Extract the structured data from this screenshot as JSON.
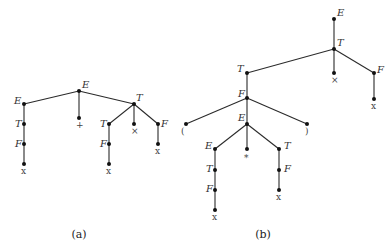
{
  "figure": {
    "captions": {
      "a": "(a)",
      "b": "(b)"
    },
    "colors": {
      "edge": "#2a2a2a",
      "node": "#111111",
      "label": "#333333"
    }
  },
  "tree_a": {
    "nodes": {
      "root": {
        "label": "E",
        "x": 79,
        "y": 91,
        "lx": 82,
        "ly": 88,
        "kind": "nt"
      },
      "e1": {
        "label": "E",
        "x": 24,
        "y": 104,
        "lx": 14,
        "ly": 104,
        "kind": "nt"
      },
      "t1": {
        "label": "T",
        "x": 24,
        "y": 124,
        "lx": 15,
        "ly": 127,
        "kind": "nt"
      },
      "f1": {
        "label": "F",
        "x": 24,
        "y": 144,
        "lx": 15,
        "ly": 147,
        "kind": "nt"
      },
      "x1": {
        "label": "x",
        "x": 24,
        "y": 164,
        "lx": 21,
        "ly": 174,
        "kind": "term"
      },
      "plus": {
        "label": "+",
        "x": 79,
        "y": 118,
        "lx": 76,
        "ly": 128,
        "kind": "term"
      },
      "t2": {
        "label": "T",
        "x": 134,
        "y": 104,
        "lx": 136,
        "ly": 101,
        "kind": "nt"
      },
      "t3": {
        "label": "T",
        "x": 109,
        "y": 124,
        "lx": 100,
        "ly": 127,
        "kind": "nt"
      },
      "f3": {
        "label": "F",
        "x": 109,
        "y": 144,
        "lx": 100,
        "ly": 147,
        "kind": "nt"
      },
      "x3": {
        "label": "x",
        "x": 109,
        "y": 164,
        "lx": 106,
        "ly": 174,
        "kind": "term"
      },
      "times": {
        "label": "×",
        "x": 134,
        "y": 124,
        "lx": 131,
        "ly": 134,
        "kind": "term"
      },
      "f4": {
        "label": "F",
        "x": 158,
        "y": 124,
        "lx": 161,
        "ly": 127,
        "kind": "nt"
      },
      "x4": {
        "label": "x",
        "x": 158,
        "y": 144,
        "lx": 155,
        "ly": 154,
        "kind": "term"
      }
    },
    "edges": [
      [
        "root",
        "e1"
      ],
      [
        "root",
        "plus"
      ],
      [
        "root",
        "t2"
      ],
      [
        "e1",
        "t1"
      ],
      [
        "t1",
        "f1"
      ],
      [
        "f1",
        "x1"
      ],
      [
        "t2",
        "t3"
      ],
      [
        "t2",
        "times"
      ],
      [
        "t2",
        "f4"
      ],
      [
        "t3",
        "f3"
      ],
      [
        "f3",
        "x3"
      ],
      [
        "f4",
        "x4"
      ]
    ]
  },
  "tree_b": {
    "nodes": {
      "root": {
        "label": "E",
        "x": 334,
        "y": 19,
        "lx": 337,
        "ly": 16,
        "kind": "nt"
      },
      "t1": {
        "label": "T",
        "x": 334,
        "y": 49,
        "lx": 337,
        "ly": 46,
        "kind": "nt"
      },
      "times": {
        "label": "×",
        "x": 334,
        "y": 73,
        "lx": 331,
        "ly": 83,
        "kind": "term"
      },
      "f1": {
        "label": "F",
        "x": 374,
        "y": 73,
        "lx": 377,
        "ly": 73,
        "kind": "nt"
      },
      "x1": {
        "label": "x",
        "x": 374,
        "y": 99,
        "lx": 371,
        "ly": 109,
        "kind": "term"
      },
      "t2": {
        "label": "T",
        "x": 247,
        "y": 73,
        "lx": 237,
        "ly": 72,
        "kind": "nt"
      },
      "f2": {
        "label": "F",
        "x": 247,
        "y": 98,
        "lx": 238,
        "ly": 97,
        "kind": "nt"
      },
      "lparen": {
        "label": "(",
        "x": 186,
        "y": 124,
        "lx": 181,
        "ly": 134,
        "kind": "term"
      },
      "e2": {
        "label": "E",
        "x": 247,
        "y": 124,
        "lx": 238,
        "ly": 121,
        "kind": "nt"
      },
      "rparen": {
        "label": ")",
        "x": 307,
        "y": 124,
        "lx": 305,
        "ly": 134,
        "kind": "term"
      },
      "e3": {
        "label": "E",
        "x": 215,
        "y": 149,
        "lx": 205,
        "ly": 149,
        "kind": "nt"
      },
      "star": {
        "label": "*",
        "x": 247,
        "y": 149,
        "lx": 244,
        "ly": 161,
        "kind": "term"
      },
      "t3": {
        "label": "T",
        "x": 279,
        "y": 149,
        "lx": 284,
        "ly": 149,
        "kind": "nt"
      },
      "t4": {
        "label": "T",
        "x": 215,
        "y": 170,
        "lx": 206,
        "ly": 172,
        "kind": "nt"
      },
      "f4": {
        "label": "F",
        "x": 215,
        "y": 190,
        "lx": 206,
        "ly": 192,
        "kind": "nt"
      },
      "x4": {
        "label": "x",
        "x": 215,
        "y": 210,
        "lx": 212,
        "ly": 220,
        "kind": "term"
      },
      "f5": {
        "label": "F",
        "x": 279,
        "y": 170,
        "lx": 284,
        "ly": 172,
        "kind": "nt"
      },
      "x5": {
        "label": "x",
        "x": 279,
        "y": 190,
        "lx": 276,
        "ly": 200,
        "kind": "term"
      }
    },
    "edges": [
      [
        "root",
        "t1"
      ],
      [
        "t1",
        "t2"
      ],
      [
        "t1",
        "times"
      ],
      [
        "t1",
        "f1"
      ],
      [
        "f1",
        "x1"
      ],
      [
        "t2",
        "f2"
      ],
      [
        "f2",
        "lparen"
      ],
      [
        "f2",
        "e2"
      ],
      [
        "f2",
        "rparen"
      ],
      [
        "e2",
        "e3"
      ],
      [
        "e2",
        "star"
      ],
      [
        "e2",
        "t3"
      ],
      [
        "e3",
        "t4"
      ],
      [
        "t4",
        "f4"
      ],
      [
        "f4",
        "x4"
      ],
      [
        "t3",
        "f5"
      ],
      [
        "f5",
        "x5"
      ]
    ]
  }
}
